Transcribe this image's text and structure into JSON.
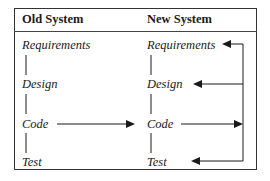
{
  "headers": {
    "old": "Old System",
    "new": "New System"
  },
  "old_system": {
    "steps": [
      "Requirements",
      "Design",
      "Code",
      "Test"
    ]
  },
  "new_system": {
    "steps": [
      "Requirements",
      "Design",
      "Code",
      "Test"
    ]
  },
  "colors": {
    "line": "#1a1a1a",
    "border": "#333333"
  }
}
